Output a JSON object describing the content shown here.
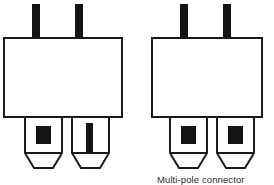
{
  "figure": {
    "background_color": "#ffffff",
    "stroke_color": "#1a1a1a",
    "fill_color": "#ffffff",
    "marker_color": "#141414"
  },
  "caption": {
    "text": "Multi-pole connector",
    "color": "#2b2b2b"
  },
  "connectors": [
    {
      "id": "left-connector",
      "name": "two-pole-connector-mixed-contacts",
      "body": {
        "x": 4,
        "y": 38,
        "width": 118,
        "height": 79
      },
      "top_terminals": [
        {
          "name": "top-terminal-left",
          "x": 32,
          "y": 4,
          "width": 8,
          "height": 35
        },
        {
          "name": "top-terminal-right",
          "x": 75,
          "y": 4,
          "width": 8,
          "height": 35
        }
      ],
      "pins": [
        {
          "name": "pin-left",
          "x": 25,
          "y": 117,
          "width": 37,
          "height": 36,
          "tip_y": 168,
          "tip_inset": 9,
          "marker": {
            "type": "square-contact",
            "x": 36,
            "y": 126,
            "width": 15,
            "height": 18
          }
        },
        {
          "name": "pin-right",
          "x": 72,
          "y": 117,
          "width": 37,
          "height": 36,
          "tip_y": 168,
          "tip_inset": 9,
          "marker": {
            "type": "slot-contact",
            "x": 86,
            "y": 123,
            "width": 7,
            "height": 28
          }
        }
      ]
    },
    {
      "id": "right-connector",
      "name": "two-pole-connector-identical-contacts",
      "body": {
        "x": 152,
        "y": 38,
        "width": 110,
        "height": 79
      },
      "top_terminals": [
        {
          "name": "top-terminal-left",
          "x": 180,
          "y": 4,
          "width": 8,
          "height": 35
        },
        {
          "name": "top-terminal-right",
          "x": 223,
          "y": 4,
          "width": 8,
          "height": 35
        }
      ],
      "pins": [
        {
          "name": "pin-left",
          "x": 170,
          "y": 117,
          "width": 37,
          "height": 36,
          "tip_y": 168,
          "tip_inset": 9,
          "marker": {
            "type": "square-contact",
            "x": 181,
            "y": 126,
            "width": 15,
            "height": 18
          }
        },
        {
          "name": "pin-right",
          "x": 217,
          "y": 117,
          "width": 37,
          "height": 36,
          "tip_y": 168,
          "tip_inset": 9,
          "marker": {
            "type": "square-contact",
            "x": 228,
            "y": 126,
            "width": 15,
            "height": 18
          }
        }
      ]
    }
  ]
}
